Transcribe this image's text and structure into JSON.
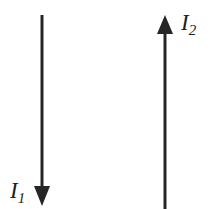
{
  "figure": {
    "background_color": "#ffffff",
    "stroke_color": "#262626",
    "width": 215,
    "height": 209,
    "wires": [
      {
        "id": "wire-1",
        "label_symbol": "I",
        "label_subscript": "1",
        "label_text": "I1",
        "direction": "down",
        "x": 42,
        "y_start": 15,
        "y_end": 206,
        "line_width": 3,
        "arrowhead": {
          "position": "bottom",
          "tip_x": 42,
          "tip_y": 206,
          "half_width": 8,
          "height": 20
        },
        "label_position": "bottom-left"
      },
      {
        "id": "wire-2",
        "label_symbol": "I",
        "label_subscript": "2",
        "label_text": "I2",
        "direction": "up",
        "x": 165,
        "y_start": 209,
        "y_end": 15,
        "line_width": 3,
        "arrowhead": {
          "position": "top",
          "tip_x": 165,
          "tip_y": 15,
          "half_width": 8,
          "height": 19
        },
        "label_position": "top-right"
      }
    ]
  }
}
